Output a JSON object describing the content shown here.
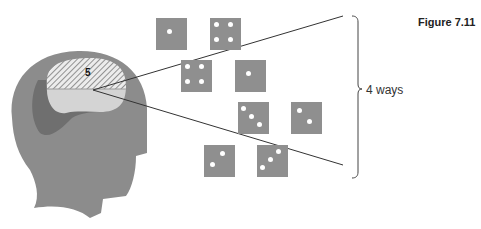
{
  "figure": {
    "title": "Figure 7.11",
    "brain_label": "5",
    "bracket_label": "4 ways",
    "colors": {
      "head": "#8c8c8c",
      "head_dark_region": "#6f6f6f",
      "brain_lower": "#d4d4d4",
      "hatch_bg": "#ececec",
      "hatch_lines": "#6a6a6a",
      "die_face": "#8f8f8f",
      "pip": "#ffffff",
      "line": "#333333"
    }
  },
  "dice": [
    {
      "id": 1,
      "value": 1,
      "x": 156,
      "y": 18,
      "pips": [
        [
          13,
          13
        ]
      ]
    },
    {
      "id": 2,
      "value": 4,
      "x": 210,
      "y": 18,
      "pips": [
        [
          6,
          6
        ],
        [
          20,
          6
        ],
        [
          6,
          21
        ],
        [
          20,
          21
        ]
      ]
    },
    {
      "id": 3,
      "value": 4,
      "x": 181,
      "y": 60,
      "pips": [
        [
          6,
          6
        ],
        [
          20,
          6
        ],
        [
          6,
          21
        ],
        [
          20,
          21
        ]
      ]
    },
    {
      "id": 4,
      "value": 1,
      "x": 235,
      "y": 60,
      "pips": [
        [
          13,
          13
        ]
      ]
    },
    {
      "id": 5,
      "value": 3,
      "x": 238,
      "y": 102,
      "pips": [
        [
          5,
          6
        ],
        [
          13,
          14
        ],
        [
          21,
          22
        ]
      ]
    },
    {
      "id": 6,
      "value": 2,
      "x": 291,
      "y": 102,
      "pips": [
        [
          8,
          8
        ],
        [
          18,
          19
        ]
      ]
    },
    {
      "id": 7,
      "value": 2,
      "x": 204,
      "y": 145,
      "pips": [
        [
          18,
          8
        ],
        [
          8,
          19
        ]
      ]
    },
    {
      "id": 8,
      "value": 3,
      "x": 257,
      "y": 145,
      "pips": [
        [
          21,
          6
        ],
        [
          13,
          14
        ],
        [
          5,
          22
        ]
      ]
    }
  ]
}
